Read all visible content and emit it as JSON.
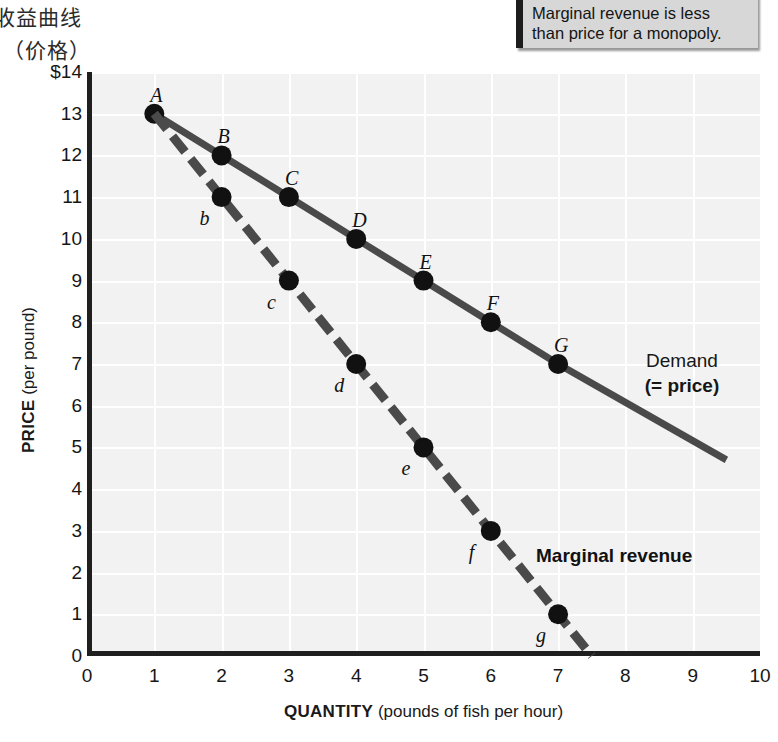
{
  "caption_cn": {
    "line1": "收益曲线",
    "line2": "（价格）"
  },
  "callout": {
    "line1": "Marginal revenue is less",
    "line2": "than price for a monopoly."
  },
  "chart_data": {
    "type": "line",
    "title": "",
    "xlabel_strong": "QUANTITY",
    "xlabel_rest": " (pounds of fish per hour)",
    "ylabel_strong": "PRICE",
    "ylabel_rest": " (per pound)",
    "xlim": [
      0,
      10
    ],
    "ylim": [
      0,
      14
    ],
    "grid": true,
    "legend_position": "inline-right",
    "xticks": [
      "0",
      "1",
      "2",
      "3",
      "4",
      "5",
      "6",
      "7",
      "8",
      "9",
      "10"
    ],
    "yticks": [
      "$14",
      "13",
      "12",
      "11",
      "10",
      "9",
      "8",
      "7",
      "6",
      "5",
      "4",
      "3",
      "2",
      "1",
      "0"
    ],
    "series": [
      {
        "name": "Demand (= price)",
        "label_line1": "Demand",
        "label_line2": "(= price)",
        "style": "solid",
        "color": "#4a4a4a",
        "x": [
          1,
          2,
          3,
          4,
          5,
          6,
          7
        ],
        "values": [
          13,
          12,
          11,
          10,
          9,
          8,
          7
        ],
        "point_labels": [
          "A",
          "B",
          "C",
          "D",
          "E",
          "F",
          "G"
        ],
        "extends_to": [
          9.5,
          4.7
        ]
      },
      {
        "name": "Marginal revenue",
        "label_line1": "Marginal revenue",
        "label_line2": "",
        "style": "dashed",
        "color": "#4a4a4a",
        "x": [
          1,
          2,
          3,
          4,
          5,
          6,
          7
        ],
        "values": [
          13,
          11,
          9,
          7,
          5,
          3,
          1
        ],
        "point_labels": [
          "A",
          "b",
          "c",
          "d",
          "e",
          "f",
          "g"
        ],
        "extends_to": [
          7.5,
          0
        ]
      }
    ]
  }
}
